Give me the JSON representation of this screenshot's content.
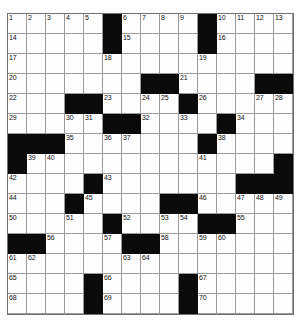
{
  "puzzle": {
    "title": "Crossword Grid",
    "rows": 15,
    "cols": 15,
    "colors": {
      "block": "#0a0a0a",
      "cell": "#fdfdfd",
      "grid_line": "#9a9a9a",
      "number_text": "#111111"
    },
    "grid": [
      [
        {
          "block": false,
          "num": "1"
        },
        {
          "block": false,
          "num": "2"
        },
        {
          "block": false,
          "num": "3"
        },
        {
          "block": false,
          "num": "4"
        },
        {
          "block": false,
          "num": "5"
        },
        {
          "block": true,
          "num": ""
        },
        {
          "block": false,
          "num": "6"
        },
        {
          "block": false,
          "num": "7"
        },
        {
          "block": false,
          "num": "8"
        },
        {
          "block": false,
          "num": "9"
        },
        {
          "block": true,
          "num": ""
        },
        {
          "block": false,
          "num": "10"
        },
        {
          "block": false,
          "num": "11"
        },
        {
          "block": false,
          "num": "12"
        },
        {
          "block": false,
          "num": "13"
        }
      ],
      [
        {
          "block": false,
          "num": "14"
        },
        {
          "block": false,
          "num": ""
        },
        {
          "block": false,
          "num": ""
        },
        {
          "block": false,
          "num": ""
        },
        {
          "block": false,
          "num": ""
        },
        {
          "block": true,
          "num": ""
        },
        {
          "block": false,
          "num": "15"
        },
        {
          "block": false,
          "num": ""
        },
        {
          "block": false,
          "num": ""
        },
        {
          "block": false,
          "num": ""
        },
        {
          "block": true,
          "num": ""
        },
        {
          "block": false,
          "num": "16"
        },
        {
          "block": false,
          "num": ""
        },
        {
          "block": false,
          "num": ""
        },
        {
          "block": false,
          "num": ""
        }
      ],
      [
        {
          "block": false,
          "num": "17"
        },
        {
          "block": false,
          "num": ""
        },
        {
          "block": false,
          "num": ""
        },
        {
          "block": false,
          "num": ""
        },
        {
          "block": false,
          "num": ""
        },
        {
          "block": false,
          "num": "18"
        },
        {
          "block": false,
          "num": ""
        },
        {
          "block": false,
          "num": ""
        },
        {
          "block": false,
          "num": ""
        },
        {
          "block": false,
          "num": ""
        },
        {
          "block": false,
          "num": "19"
        },
        {
          "block": false,
          "num": ""
        },
        {
          "block": false,
          "num": ""
        },
        {
          "block": false,
          "num": ""
        },
        {
          "block": false,
          "num": ""
        }
      ],
      [
        {
          "block": false,
          "num": "20"
        },
        {
          "block": false,
          "num": ""
        },
        {
          "block": false,
          "num": ""
        },
        {
          "block": false,
          "num": ""
        },
        {
          "block": false,
          "num": ""
        },
        {
          "block": false,
          "num": ""
        },
        {
          "block": false,
          "num": ""
        },
        {
          "block": true,
          "num": ""
        },
        {
          "block": true,
          "num": ""
        },
        {
          "block": false,
          "num": "21"
        },
        {
          "block": false,
          "num": ""
        },
        {
          "block": false,
          "num": ""
        },
        {
          "block": false,
          "num": ""
        },
        {
          "block": true,
          "num": ""
        },
        {
          "block": true,
          "num": ""
        }
      ],
      [
        {
          "block": false,
          "num": "22"
        },
        {
          "block": false,
          "num": ""
        },
        {
          "block": false,
          "num": ""
        },
        {
          "block": true,
          "num": ""
        },
        {
          "block": true,
          "num": ""
        },
        {
          "block": false,
          "num": "23"
        },
        {
          "block": false,
          "num": ""
        },
        {
          "block": false,
          "num": "24"
        },
        {
          "block": false,
          "num": "25"
        },
        {
          "block": true,
          "num": ""
        },
        {
          "block": false,
          "num": "26"
        },
        {
          "block": false,
          "num": ""
        },
        {
          "block": false,
          "num": ""
        },
        {
          "block": false,
          "num": "27"
        },
        {
          "block": false,
          "num": "28"
        }
      ],
      [
        {
          "block": false,
          "num": "29"
        },
        {
          "block": false,
          "num": ""
        },
        {
          "block": false,
          "num": ""
        },
        {
          "block": false,
          "num": "30"
        },
        {
          "block": false,
          "num": "31"
        },
        {
          "block": true,
          "num": ""
        },
        {
          "block": true,
          "num": ""
        },
        {
          "block": false,
          "num": "32"
        },
        {
          "block": false,
          "num": ""
        },
        {
          "block": false,
          "num": "33"
        },
        {
          "block": false,
          "num": ""
        },
        {
          "block": true,
          "num": ""
        },
        {
          "block": false,
          "num": "34"
        },
        {
          "block": false,
          "num": ""
        },
        {
          "block": false,
          "num": ""
        }
      ],
      [
        {
          "block": true,
          "num": ""
        },
        {
          "block": true,
          "num": ""
        },
        {
          "block": true,
          "num": ""
        },
        {
          "block": false,
          "num": "35"
        },
        {
          "block": false,
          "num": ""
        },
        {
          "block": false,
          "num": "36"
        },
        {
          "block": false,
          "num": "37"
        },
        {
          "block": false,
          "num": ""
        },
        {
          "block": false,
          "num": ""
        },
        {
          "block": false,
          "num": ""
        },
        {
          "block": true,
          "num": ""
        },
        {
          "block": false,
          "num": "38"
        },
        {
          "block": false,
          "num": ""
        },
        {
          "block": false,
          "num": ""
        },
        {
          "block": false,
          "num": ""
        }
      ],
      [
        {
          "block": true,
          "num": ""
        },
        {
          "block": false,
          "num": "39"
        },
        {
          "block": false,
          "num": "40"
        },
        {
          "block": false,
          "num": ""
        },
        {
          "block": false,
          "num": ""
        },
        {
          "block": false,
          "num": ""
        },
        {
          "block": false,
          "num": ""
        },
        {
          "block": false,
          "num": ""
        },
        {
          "block": false,
          "num": ""
        },
        {
          "block": false,
          "num": ""
        },
        {
          "block": false,
          "num": "41"
        },
        {
          "block": false,
          "num": ""
        },
        {
          "block": false,
          "num": ""
        },
        {
          "block": false,
          "num": ""
        },
        {
          "block": true,
          "num": ""
        }
      ],
      [
        {
          "block": false,
          "num": "42"
        },
        {
          "block": false,
          "num": ""
        },
        {
          "block": false,
          "num": ""
        },
        {
          "block": false,
          "num": ""
        },
        {
          "block": true,
          "num": ""
        },
        {
          "block": false,
          "num": "43"
        },
        {
          "block": false,
          "num": ""
        },
        {
          "block": false,
          "num": ""
        },
        {
          "block": false,
          "num": ""
        },
        {
          "block": false,
          "num": ""
        },
        {
          "block": false,
          "num": ""
        },
        {
          "block": false,
          "num": ""
        },
        {
          "block": true,
          "num": ""
        },
        {
          "block": true,
          "num": ""
        },
        {
          "block": true,
          "num": ""
        }
      ],
      [
        {
          "block": false,
          "num": "44"
        },
        {
          "block": false,
          "num": ""
        },
        {
          "block": false,
          "num": ""
        },
        {
          "block": true,
          "num": ""
        },
        {
          "block": false,
          "num": "45"
        },
        {
          "block": false,
          "num": ""
        },
        {
          "block": false,
          "num": ""
        },
        {
          "block": false,
          "num": ""
        },
        {
          "block": true,
          "num": ""
        },
        {
          "block": true,
          "num": ""
        },
        {
          "block": false,
          "num": "46"
        },
        {
          "block": false,
          "num": ""
        },
        {
          "block": false,
          "num": "47"
        },
        {
          "block": false,
          "num": "48"
        },
        {
          "block": false,
          "num": "49"
        }
      ],
      [
        {
          "block": false,
          "num": "50"
        },
        {
          "block": false,
          "num": ""
        },
        {
          "block": false,
          "num": ""
        },
        {
          "block": false,
          "num": "51"
        },
        {
          "block": false,
          "num": ""
        },
        {
          "block": true,
          "num": ""
        },
        {
          "block": false,
          "num": "52"
        },
        {
          "block": false,
          "num": ""
        },
        {
          "block": false,
          "num": "53"
        },
        {
          "block": false,
          "num": "54"
        },
        {
          "block": true,
          "num": ""
        },
        {
          "block": true,
          "num": ""
        },
        {
          "block": false,
          "num": "55"
        },
        {
          "block": false,
          "num": ""
        },
        {
          "block": false,
          "num": ""
        }
      ],
      [
        {
          "block": true,
          "num": ""
        },
        {
          "block": true,
          "num": ""
        },
        {
          "block": false,
          "num": "56"
        },
        {
          "block": false,
          "num": ""
        },
        {
          "block": false,
          "num": ""
        },
        {
          "block": false,
          "num": "57"
        },
        {
          "block": true,
          "num": ""
        },
        {
          "block": true,
          "num": ""
        },
        {
          "block": false,
          "num": "58"
        },
        {
          "block": false,
          "num": ""
        },
        {
          "block": false,
          "num": "59"
        },
        {
          "block": false,
          "num": "60"
        },
        {
          "block": false,
          "num": ""
        },
        {
          "block": false,
          "num": ""
        },
        {
          "block": false,
          "num": ""
        }
      ],
      [
        {
          "block": false,
          "num": "61"
        },
        {
          "block": false,
          "num": "62"
        },
        {
          "block": false,
          "num": ""
        },
        {
          "block": false,
          "num": ""
        },
        {
          "block": false,
          "num": ""
        },
        {
          "block": false,
          "num": ""
        },
        {
          "block": false,
          "num": "63"
        },
        {
          "block": false,
          "num": "64"
        },
        {
          "block": false,
          "num": ""
        },
        {
          "block": false,
          "num": ""
        },
        {
          "block": false,
          "num": ""
        },
        {
          "block": false,
          "num": ""
        },
        {
          "block": false,
          "num": ""
        },
        {
          "block": false,
          "num": ""
        },
        {
          "block": false,
          "num": ""
        }
      ],
      [
        {
          "block": false,
          "num": "65"
        },
        {
          "block": false,
          "num": ""
        },
        {
          "block": false,
          "num": ""
        },
        {
          "block": false,
          "num": ""
        },
        {
          "block": true,
          "num": ""
        },
        {
          "block": false,
          "num": "66"
        },
        {
          "block": false,
          "num": ""
        },
        {
          "block": false,
          "num": ""
        },
        {
          "block": false,
          "num": ""
        },
        {
          "block": true,
          "num": ""
        },
        {
          "block": false,
          "num": "67"
        },
        {
          "block": false,
          "num": ""
        },
        {
          "block": false,
          "num": ""
        },
        {
          "block": false,
          "num": ""
        },
        {
          "block": false,
          "num": ""
        }
      ],
      [
        {
          "block": false,
          "num": "68"
        },
        {
          "block": false,
          "num": ""
        },
        {
          "block": false,
          "num": ""
        },
        {
          "block": false,
          "num": ""
        },
        {
          "block": true,
          "num": ""
        },
        {
          "block": false,
          "num": "69"
        },
        {
          "block": false,
          "num": ""
        },
        {
          "block": false,
          "num": ""
        },
        {
          "block": false,
          "num": ""
        },
        {
          "block": true,
          "num": ""
        },
        {
          "block": false,
          "num": "70"
        },
        {
          "block": false,
          "num": ""
        },
        {
          "block": false,
          "num": ""
        },
        {
          "block": false,
          "num": ""
        },
        {
          "block": false,
          "num": ""
        }
      ]
    ]
  }
}
